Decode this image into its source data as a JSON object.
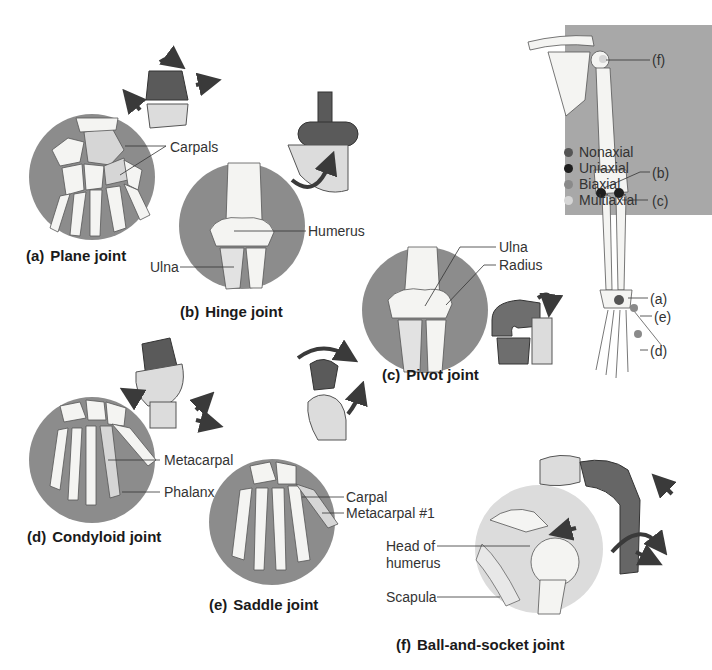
{
  "figure": {
    "colors": {
      "circle_bg": "#8c8c8c",
      "bone": "#f4f4f2",
      "bone_shaded": "#d6d6d6",
      "model_dark": "#5a5a5a",
      "model_light": "#dcdcdc",
      "arrow": "#3a3a3a",
      "panel_bg": "#a8a8a8"
    }
  },
  "legend": {
    "items": [
      {
        "label": "Nonaxial",
        "color": "#555555"
      },
      {
        "label": "Uniaxial",
        "color": "#1e1e1e"
      },
      {
        "label": "Biaxial",
        "color": "#8a8a8a"
      },
      {
        "label": "Multiaxial",
        "color": "#d6d6d6"
      }
    ]
  },
  "arm_diagram": {
    "markers": [
      "(f)",
      "(b)",
      "(c)",
      "(a)",
      "(e)",
      "(d)"
    ]
  },
  "panels": {
    "a": {
      "tag": "(a)",
      "title": "Plane joint",
      "labels": [
        "Carpals"
      ]
    },
    "b": {
      "tag": "(b)",
      "title": "Hinge joint",
      "labels": [
        "Humerus",
        "Ulna"
      ]
    },
    "c": {
      "tag": "(c)",
      "title": "Pivot joint",
      "labels": [
        "Ulna",
        "Radius"
      ]
    },
    "d": {
      "tag": "(d)",
      "title": "Condyloid joint",
      "labels": [
        "Metacarpal",
        "Phalanx"
      ]
    },
    "e": {
      "tag": "(e)",
      "title": "Saddle joint",
      "labels": [
        "Carpal",
        "Metacarpal #1"
      ]
    },
    "f": {
      "tag": "(f)",
      "title": "Ball-and-socket joint",
      "labels": [
        "Head of",
        "humerus",
        "Scapula"
      ]
    }
  }
}
